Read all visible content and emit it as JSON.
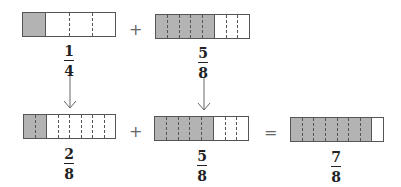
{
  "diagram": {
    "colors": {
      "shaded": "#b3b3b3",
      "outline": "#555555",
      "text": "#222222"
    },
    "top_row": {
      "left_fraction": {
        "numerator": "1",
        "denominator": "4",
        "parts": 4,
        "shaded": 1
      },
      "operator": "+",
      "right_fraction": {
        "numerator": "5",
        "denominator": "8",
        "parts": 8,
        "shaded": 5
      }
    },
    "bottom_row": {
      "left_fraction": {
        "numerator": "2",
        "denominator": "8",
        "parts": 8,
        "shaded": 2
      },
      "operator_plus": "+",
      "right_fraction": {
        "numerator": "5",
        "denominator": "8",
        "parts": 8,
        "shaded": 5
      },
      "operator_equals": "=",
      "result_fraction": {
        "numerator": "7",
        "denominator": "8",
        "parts": 8,
        "shaded": 7
      }
    },
    "arrows": [
      "down-arrow",
      "down-arrow"
    ]
  }
}
